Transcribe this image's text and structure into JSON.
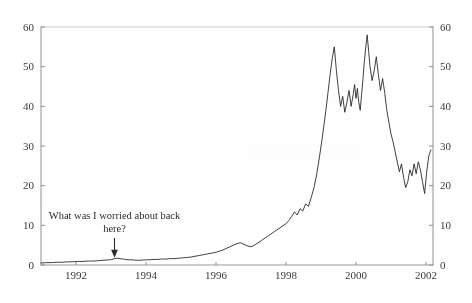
{
  "chart_data": {
    "type": "line",
    "title": "",
    "subtitle": "",
    "xlabel": "",
    "ylabel": "",
    "xlim": [
      1991.0,
      2002.2
    ],
    "ylim": [
      0,
      60
    ],
    "grid": false,
    "legend": "none",
    "y_ticks": [
      0,
      10,
      20,
      30,
      40,
      50,
      60
    ],
    "y_ticks_right": [
      0,
      10,
      20,
      30,
      40,
      50,
      60
    ],
    "x_ticks": [
      1992,
      1994,
      1996,
      1998,
      2000,
      2002
    ],
    "y_tick_labels": [
      "0",
      "10",
      "20",
      "30",
      "40",
      "50",
      "60"
    ],
    "y_tick_labels_right": [
      "0",
      "10",
      "20",
      "30",
      "40",
      "50",
      "60"
    ],
    "x_tick_labels": [
      "1992",
      "1994",
      "1996",
      "1998",
      "2000",
      "2002"
    ],
    "series": [
      {
        "name": "price",
        "x": [
          1991.0,
          1991.15,
          1991.3,
          1991.45,
          1991.6,
          1991.75,
          1991.9,
          1992.05,
          1992.2,
          1992.35,
          1992.5,
          1992.65,
          1992.8,
          1992.95,
          1993.02,
          1993.1,
          1993.18,
          1993.26,
          1993.34,
          1993.42,
          1993.5,
          1993.6,
          1993.72,
          1993.84,
          1993.96,
          1994.08,
          1994.2,
          1994.32,
          1994.44,
          1994.56,
          1994.68,
          1994.8,
          1994.92,
          1995.04,
          1995.16,
          1995.28,
          1995.4,
          1995.52,
          1995.64,
          1995.76,
          1995.88,
          1996.0,
          1996.1,
          1996.2,
          1996.3,
          1996.4,
          1996.5,
          1996.6,
          1996.7,
          1996.8,
          1996.9,
          1997.0,
          1997.1,
          1997.2,
          1997.3,
          1997.4,
          1997.5,
          1997.6,
          1997.7,
          1997.8,
          1997.9,
          1998.0,
          1998.08,
          1998.16,
          1998.24,
          1998.32,
          1998.4,
          1998.48,
          1998.56,
          1998.64,
          1998.72,
          1998.8,
          1998.88,
          1998.96,
          1999.02,
          1999.08,
          1999.14,
          1999.2,
          1999.26,
          1999.32,
          1999.38,
          1999.44,
          1999.5,
          1999.56,
          1999.62,
          1999.68,
          1999.74,
          1999.8,
          1999.86,
          1999.92,
          1999.96,
          2000.0,
          2000.04,
          2000.08,
          2000.12,
          2000.16,
          2000.2,
          2000.24,
          2000.28,
          2000.32,
          2000.36,
          2000.4,
          2000.46,
          2000.52,
          2000.58,
          2000.64,
          2000.7,
          2000.76,
          2000.82,
          2000.88,
          2000.94,
          2001.0,
          2001.06,
          2001.12,
          2001.18,
          2001.24,
          2001.3,
          2001.36,
          2001.42,
          2001.48,
          2001.54,
          2001.6,
          2001.66,
          2001.72,
          2001.78,
          2001.84,
          2001.9,
          2001.96,
          2002.02,
          2002.08,
          2002.14
        ],
        "y": [
          0.5,
          0.6,
          0.6,
          0.7,
          0.7,
          0.8,
          0.8,
          0.9,
          0.9,
          1.0,
          1.0,
          1.1,
          1.2,
          1.3,
          1.4,
          1.6,
          1.7,
          1.6,
          1.5,
          1.4,
          1.3,
          1.3,
          1.2,
          1.2,
          1.3,
          1.3,
          1.4,
          1.4,
          1.5,
          1.5,
          1.6,
          1.6,
          1.7,
          1.8,
          1.9,
          2.0,
          2.2,
          2.4,
          2.6,
          2.8,
          3.0,
          3.2,
          3.5,
          3.8,
          4.2,
          4.6,
          5.0,
          5.4,
          5.6,
          5.2,
          4.8,
          4.6,
          5.0,
          5.6,
          6.2,
          6.8,
          7.4,
          8.0,
          8.6,
          9.2,
          9.8,
          10.4,
          11.2,
          12.2,
          13.4,
          12.6,
          14.2,
          13.6,
          15.4,
          14.8,
          17.0,
          19.5,
          23.0,
          27.5,
          31.0,
          35.0,
          39.0,
          43.5,
          48.0,
          52.0,
          55.0,
          49.0,
          44.0,
          40.0,
          42.5,
          38.5,
          41.0,
          44.0,
          40.0,
          43.0,
          45.5,
          42.0,
          44.5,
          41.0,
          39.0,
          43.0,
          47.0,
          51.5,
          55.0,
          58.0,
          54.0,
          50.0,
          46.5,
          49.0,
          52.5,
          48.0,
          44.0,
          47.0,
          43.5,
          39.0,
          36.0,
          33.0,
          31.0,
          28.5,
          26.0,
          23.5,
          25.5,
          22.0,
          19.5,
          21.0,
          24.0,
          22.5,
          25.5,
          23.0,
          26.0,
          24.0,
          21.0,
          18.0,
          23.5,
          27.5,
          29.0
        ]
      }
    ],
    "annotations": [
      {
        "id": "worried-note",
        "text_line_1": "What was I worried about back",
        "text_line_2": "here?",
        "points_to_x": 1993.1,
        "points_to_y": 1.6,
        "arrow": "down"
      }
    ]
  },
  "axes": {
    "left_axis_name": "left-value-axis",
    "right_axis_name": "right-value-axis",
    "bottom_axis_name": "year-axis"
  },
  "colors": {
    "series_stroke": "#1d1d1d",
    "axis": "#9a9a9a",
    "text": "#2b2b2b",
    "background": "#ffffff",
    "frame": "#c9c9c9"
  }
}
